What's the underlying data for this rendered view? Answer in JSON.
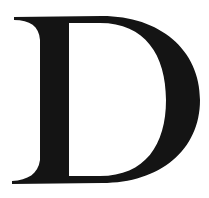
{
  "glyph": {
    "character": "D",
    "style": "serif",
    "color": "#141414",
    "background": "#ffffff"
  }
}
